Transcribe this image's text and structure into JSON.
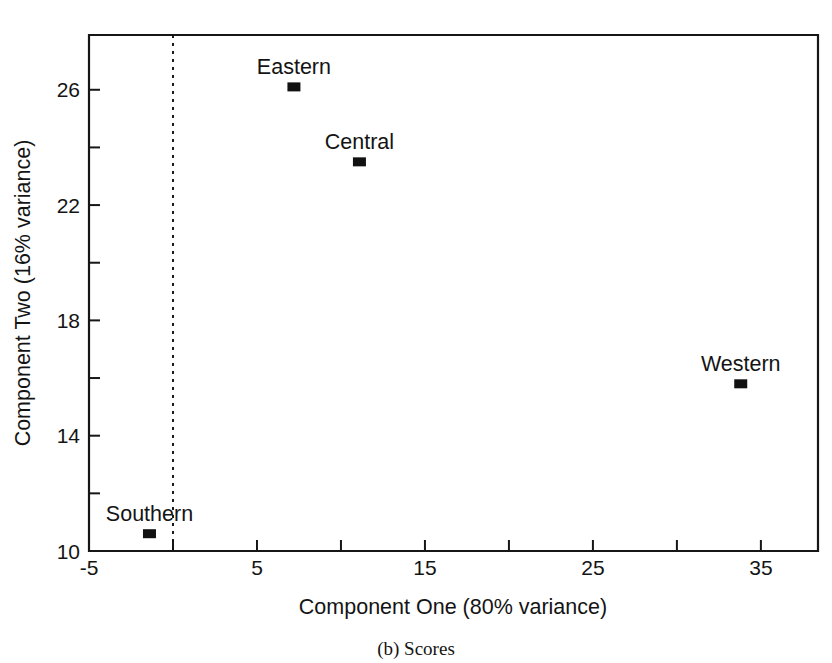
{
  "chart_data": {
    "type": "scatter",
    "title": "",
    "caption": "(b) Scores",
    "xlabel": "Component One (80% variance)",
    "ylabel": "Component Two (16% variance)",
    "xlim": [
      -5,
      38.4
    ],
    "ylim": [
      10,
      27.9
    ],
    "grid": false,
    "legend": "none",
    "x_ticks_major": [
      -5,
      5,
      15,
      25,
      35
    ],
    "x_tick_labels": [
      "-5",
      "5",
      "15",
      "25",
      "35"
    ],
    "x_ticks_minor": [
      0,
      10,
      20,
      30
    ],
    "y_ticks_major": [
      10,
      14,
      18,
      22,
      26
    ],
    "y_tick_labels": [
      "10",
      "14",
      "18",
      "22",
      "26"
    ],
    "y_ticks_minor": [
      12,
      16,
      20,
      24
    ],
    "reference_line": {
      "orientation": "vertical",
      "x": 0,
      "style": "dotted"
    },
    "points": [
      {
        "label": "Eastern",
        "x": 7.2,
        "y": 26.1,
        "label_position": "above"
      },
      {
        "label": "Central",
        "x": 11.1,
        "y": 23.5,
        "label_position": "above"
      },
      {
        "label": "Western",
        "x": 33.8,
        "y": 15.8,
        "label_position": "above"
      },
      {
        "label": "Southern",
        "x": -1.4,
        "y": 10.6,
        "label_position": "above"
      }
    ],
    "colors": {
      "marker": "#111111",
      "axis": "#161616",
      "text": "#141414",
      "background": "#ffffff"
    }
  }
}
